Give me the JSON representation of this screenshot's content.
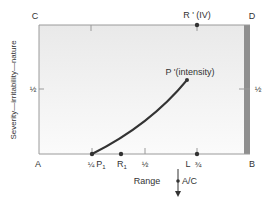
{
  "diagram": {
    "corners": {
      "top_left": "C",
      "top_right": "D",
      "bottom_left": "A",
      "bottom_right": "B"
    },
    "y_axis_label": "Severity—irritability—nature",
    "x_axis_label": "Range",
    "y_ticks": [
      {
        "label": "½",
        "value": 0.5
      }
    ],
    "right_ticks": [
      {
        "label": "½",
        "value": 0.5
      }
    ],
    "x_ticks": [
      {
        "label": "¼",
        "value": 0.25
      },
      {
        "label": "½",
        "value": 0.5
      },
      {
        "label": "¾",
        "value": 0.75
      }
    ],
    "points": {
      "P1": {
        "label": "P",
        "sub": "1",
        "x": 0.25,
        "y": 0
      },
      "R1": {
        "label": "R",
        "sub": "1",
        "x": 0.39,
        "y": 0
      },
      "L": {
        "label": "L",
        "x": 0.75,
        "y": 0
      },
      "R_prime": {
        "label": "R ' (IV)",
        "x": 0.75,
        "y": 1
      },
      "P_prime": {
        "label": "P '(intensity)",
        "x": 0.7,
        "y": 0.57
      }
    },
    "top_ticks": [
      {
        "value": 0.25
      }
    ],
    "arrow_label": "A/C",
    "colors": {
      "line": "#333333",
      "box_fill_top": "#ececec",
      "box_fill_bottom": "#fafafa",
      "right_bar": "#8f8f8f",
      "axis": "#9a9a9a"
    }
  }
}
